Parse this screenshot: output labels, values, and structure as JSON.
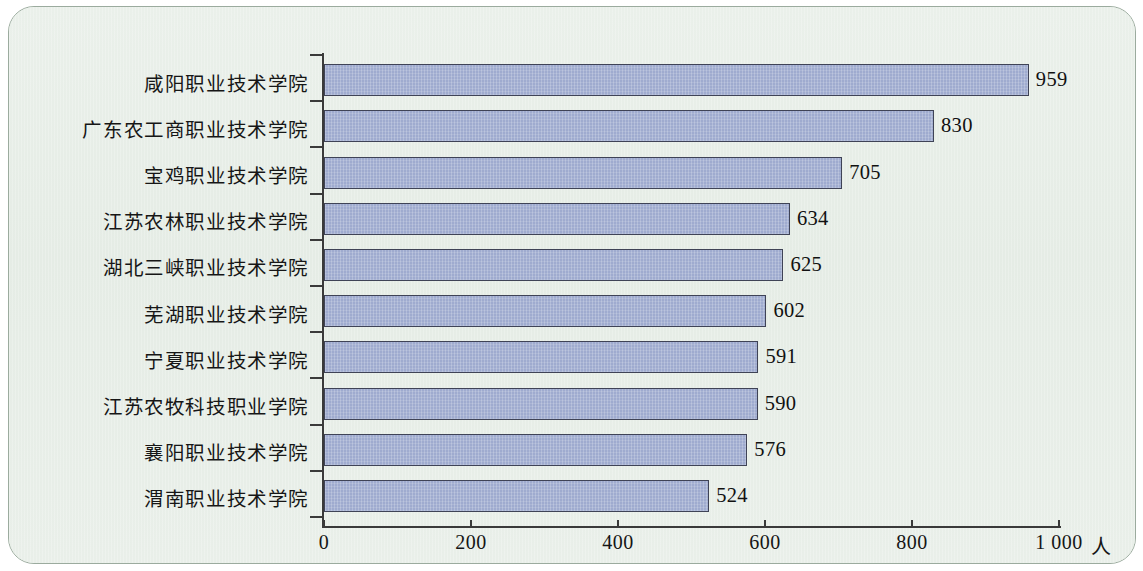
{
  "chart_data": {
    "type": "bar",
    "orientation": "horizontal",
    "title": "",
    "subtitle": "",
    "xlabel": "人",
    "ylabel": "",
    "xlim": [
      0,
      1000
    ],
    "grid": false,
    "legend": null,
    "categories": [
      "咸阳职业技术学院",
      "广东农工商职业技术学院",
      "宝鸡职业技术学院",
      "江苏农林职业技术学院",
      "湖北三峡职业技术学院",
      "芜湖职业技术学院",
      "宁夏职业技术学院",
      "江苏农牧科技职业学院",
      "襄阳职业技术学院",
      "渭南职业技术学院"
    ],
    "values": [
      959,
      830,
      705,
      634,
      625,
      602,
      591,
      590,
      576,
      524
    ],
    "value_labels": [
      "959",
      "830",
      "705",
      "634",
      "625",
      "602",
      "591",
      "590",
      "576",
      "524"
    ],
    "xticks": [
      0,
      200,
      400,
      600,
      800,
      1000
    ],
    "xtick_labels": [
      "0",
      "200",
      "400",
      "600",
      "800",
      "1 000"
    ],
    "unit_label": "人",
    "colors": {
      "bar_fill": "#9fabcf",
      "bar_border": "#3f4356",
      "axis": "#3a3a3a",
      "panel_background": "#e8eee8",
      "panel_border": "#9bab9e",
      "text": "#151515"
    }
  }
}
